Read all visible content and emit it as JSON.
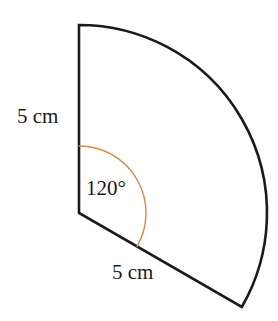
{
  "figure": {
    "type": "circular-sector",
    "background_color": "#ffffff",
    "outline_color": "#1a1a1a",
    "outline_width": 2.6,
    "angle_marker_color": "#e5833c",
    "angle_marker_width": 1.4,
    "center": {
      "x": 79,
      "y": 213
    },
    "radius_px": 188,
    "angle_marker_radius_px": 67,
    "start_angle_deg": 90,
    "sweep_angle_deg": 120,
    "vertices": {
      "center": {
        "x": 79,
        "y": 213
      },
      "arc_start": {
        "x": 79,
        "y": 25
      },
      "arc_end": {
        "x": 238,
        "y": 307
      }
    }
  },
  "labels": {
    "radius_vertical": "5 cm",
    "radius_lower": "5 cm",
    "angle": "120°"
  }
}
